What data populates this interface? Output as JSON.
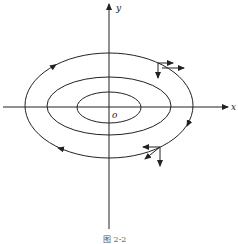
{
  "figure": {
    "caption": "图 2-2",
    "axes": {
      "x_label": "x",
      "y_label": "y",
      "origin_label": "o"
    },
    "ellipses": [
      {
        "name": "inner",
        "cx": 109,
        "cy": 107.5,
        "rx": 32,
        "ry": 15.5
      },
      {
        "name": "middle",
        "cx": 109,
        "cy": 106,
        "rx": 62,
        "ry": 29
      },
      {
        "name": "outer",
        "cx": 109,
        "cy": 105.5,
        "rx": 84,
        "ry": 52.5
      }
    ],
    "flow_direction": "clockwise",
    "vector_decompositions": [
      {
        "name": "top-right",
        "point": [
          158,
          63
        ],
        "components": [
          "right",
          "down",
          "tangent"
        ]
      },
      {
        "name": "bottom-right",
        "point": [
          160,
          147
        ],
        "components": [
          "left",
          "down",
          "tangent"
        ]
      }
    ],
    "colors": {
      "stroke": "#222222",
      "background": "#ffffff"
    }
  }
}
